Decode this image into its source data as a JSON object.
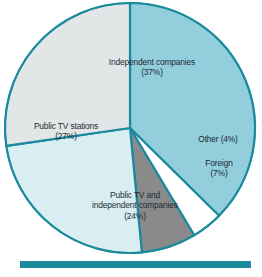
{
  "chart_data": {
    "type": "pie",
    "title": "",
    "subtitle": "",
    "xlabel": "",
    "ylabel": "",
    "legend_position": "none",
    "grid": false,
    "labels_inline": true,
    "start_angle_deg": 0,
    "direction": "clockwise",
    "total_percent": 99,
    "categories": [
      "Independent companies",
      "Other",
      "Foreign",
      "Public TV and independent companies",
      "Public TV stations"
    ],
    "values": [
      37,
      4,
      7,
      24,
      27
    ],
    "slices": [
      {
        "name": "Independent companies",
        "label_line1": "Independent companies",
        "label_line2": "(37%)",
        "label_text": "Independent companies\n(37%)",
        "value": 37,
        "value_text": "(37%)",
        "color": "#93ced d"
      },
      {
        "name": "Other",
        "label_line1": "Other (4%)",
        "label_line2": "",
        "label_text": "Other (4%)",
        "value": 4,
        "value_text": "(4%)",
        "color": "#ffffff"
      },
      {
        "name": "Foreign",
        "label_line1": "Foreign",
        "label_line2": "(7%)",
        "label_text": "Foreign\n(7%)",
        "value": 7,
        "value_text": "(7%)",
        "color": "#8a8a8a"
      },
      {
        "name": "Public TV and independent companies",
        "label_line1": "Public TV and",
        "label_line2": "independent companies",
        "label_line3": "(24%)",
        "label_text": "Public TV and\nindependent companies\n(24%)",
        "value": 24,
        "value_text": "(24%)",
        "color": "#d8eef2"
      },
      {
        "name": "Public TV stations",
        "label_line1": "Public TV stations",
        "label_line2": "(27%)",
        "label_text": "Public TV stations\n(27%)",
        "value": 27,
        "value_text": "(27%)",
        "color": "#e2e6e6"
      }
    ]
  },
  "colors": {
    "slice_independent": "#93cedd",
    "slice_other": "#ffffff",
    "slice_foreign": "#8a8a8a",
    "slice_public_and_independent": "#d8eef2",
    "slice_public_tv_stations": "#e2e6e6",
    "separator": "#1b8a9c",
    "outline": "#1b8a9c",
    "rule": "#1b8a9c",
    "label_text": "#1d2b33",
    "background": "#ffffff"
  },
  "footer": {
    "rule_present": true
  }
}
